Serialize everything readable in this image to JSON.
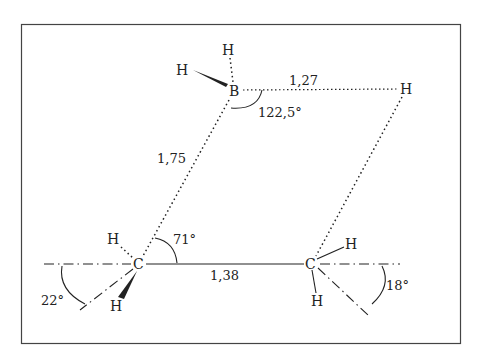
{
  "diagram": {
    "atoms": {
      "B": "B",
      "H_B_top": "H",
      "H_B_left": "H",
      "H_bridge": "H",
      "C_left": "C",
      "H_Cleft_up": "H",
      "H_Cleft_down": "H",
      "C_right": "C",
      "H_Cright_up": "H",
      "H_Cright_down": "H"
    },
    "bond_lengths": {
      "B_H_bridge": "1,27",
      "B_C_left": "1,75",
      "C_C": "1,38"
    },
    "angles": {
      "H_B_C": "122,5°",
      "B_C_C": "71°",
      "left_tilt": "22°",
      "right_tilt": "18°"
    },
    "colors": {
      "ink": "#222222",
      "background": "#ffffff",
      "frame": "#444444"
    }
  }
}
